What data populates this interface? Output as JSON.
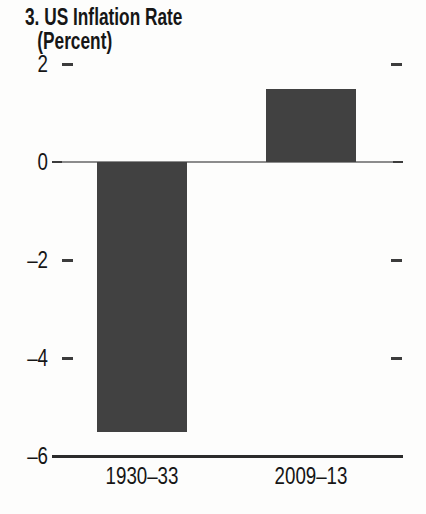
{
  "figure": {
    "title": "3. US Inflation Rate",
    "subtitle": "(Percent)"
  },
  "chart_data": {
    "type": "bar",
    "title": "3. US Inflation Rate",
    "unit_label": "(Percent)",
    "categories": [
      "1930–33",
      "2009–13"
    ],
    "values": [
      -5.5,
      1.5
    ],
    "ylim": [
      -6,
      2
    ],
    "yticks": [
      2,
      0,
      -2,
      -4,
      -6
    ],
    "ylabel": "Percent",
    "grid": false,
    "legend": "none",
    "bar_color": "#414141"
  },
  "colors": {
    "background": "#fdfdfc",
    "text": "#161616",
    "axis_line": "#2b2b2b",
    "zero_line": "#8c8c8c",
    "tick_mark": "#3c3c3c",
    "bar": "#414141"
  }
}
